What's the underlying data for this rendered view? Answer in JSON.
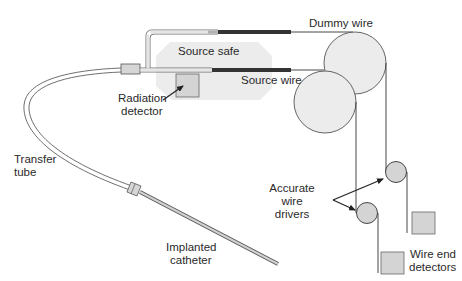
{
  "diagram": {
    "labels": {
      "dummy_wire": "Dummy wire",
      "source_safe": "Source safe",
      "source_wire": "Source wire",
      "radiation_detector_line1": "Radiation",
      "radiation_detector_line2": "detector",
      "transfer_tube_line1": "Transfer",
      "transfer_tube_line2": "tube",
      "accurate_wire_drivers_line1": "Accurate",
      "accurate_wire_drivers_line2": "wire",
      "accurate_wire_drivers_line3": "drivers",
      "implanted_catheter_line1": "Implanted",
      "implanted_catheter_line2": "catheter",
      "wire_end_detectors_line1": "Wire end",
      "wire_end_detectors_line2": "detectors"
    },
    "colors": {
      "line": "#3a3a3a",
      "safe_fill": "#ececec",
      "circle_fill": "#ececec",
      "pulley_fill": "#d4d4d4",
      "detector_fill": "#d4d4d4",
      "wire_dark": "#333333"
    }
  }
}
